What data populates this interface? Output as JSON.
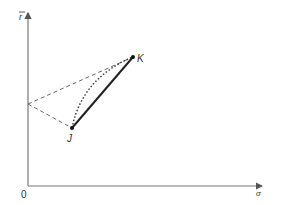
{
  "diagram": {
    "axes": {
      "origin_label": "0",
      "y_label": "r",
      "x_label": "σ",
      "color": "#666666"
    },
    "points": {
      "K": {
        "label": "K"
      },
      "J": {
        "label": "J"
      }
    },
    "lines": {
      "solid_color": "#222222",
      "dashed_color": "#555555",
      "dotted_color": "#333333"
    }
  }
}
